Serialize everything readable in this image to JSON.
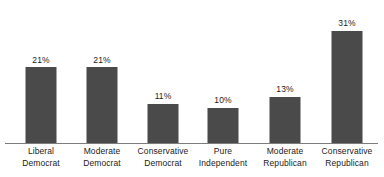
{
  "chart_data": {
    "type": "bar",
    "title": "",
    "subtitle": "",
    "xlabel": "",
    "ylabel": "",
    "ylim": [
      0,
      35
    ],
    "grid": false,
    "legend": false,
    "value_suffix": "%",
    "orientation": "vertical",
    "bar_color": "#4a4a4a",
    "axis_color": "#7d7d7d",
    "background": "#ffffff",
    "text_color": "#1b1b1b",
    "categories": [
      "Liberal Democrat",
      "Moderate Democrat",
      "Conservative Democrat",
      "Pure Independent",
      "Moderate Republican",
      "Conservative Republican"
    ],
    "category_lines": [
      [
        "Liberal",
        "Democrat"
      ],
      [
        "Moderate",
        "Democrat"
      ],
      [
        "Conservative",
        "Democrat"
      ],
      [
        "Pure",
        "Independent"
      ],
      [
        "Moderate",
        "Republican"
      ],
      [
        "Conservative",
        "Republican"
      ]
    ],
    "values": [
      21,
      21,
      11,
      10,
      13,
      31
    ],
    "value_labels": [
      "21%",
      "21%",
      "11%",
      "10%",
      "13%",
      "31%"
    ],
    "bar_centers_px": [
      41,
      102,
      163,
      223,
      285,
      347
    ]
  }
}
